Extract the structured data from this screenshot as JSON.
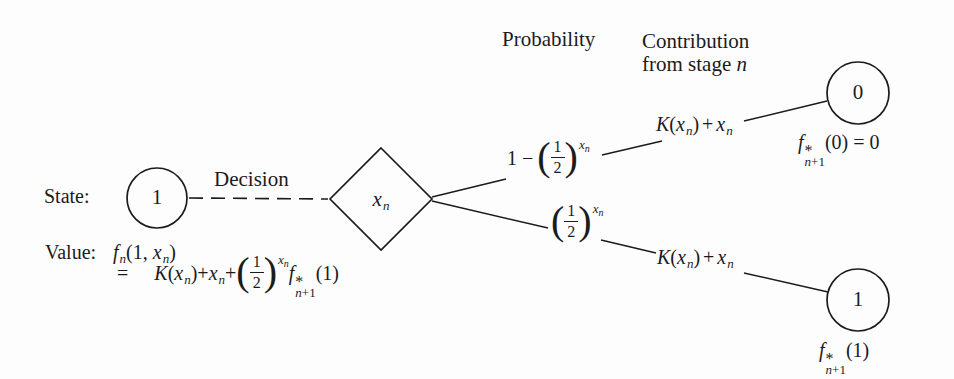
{
  "figure": {
    "headers": {
      "probability": "Probability",
      "contribution_line1": "Contribution",
      "contribution_line2_prefix": "from stage ",
      "contribution_line2_var": "n"
    },
    "labels": {
      "state": "State:",
      "value": "Value:",
      "decision": "Decision"
    },
    "nodes": {
      "state_value": "1",
      "decision_var_base": "x",
      "decision_var_sub": "n",
      "outcome_top_value": "0",
      "outcome_bottom_value": "1"
    },
    "glyphs": {
      "f": "f",
      "x": "x",
      "n": "n",
      "K": "K",
      "one": "1",
      "two": "2",
      "zero": "0",
      "plus": "+",
      "one_minus": "1 −",
      "equals": "=",
      "asterisk": "*",
      "plus_one": "+1",
      "lparen": "(",
      "rparen": ")",
      "arg_zero": "(0)",
      "arg_one": "(1)",
      "open_one_comma": "(1, "
    },
    "colors": {
      "ink": "#1b1b1b",
      "background": "#fdfdfd"
    }
  }
}
